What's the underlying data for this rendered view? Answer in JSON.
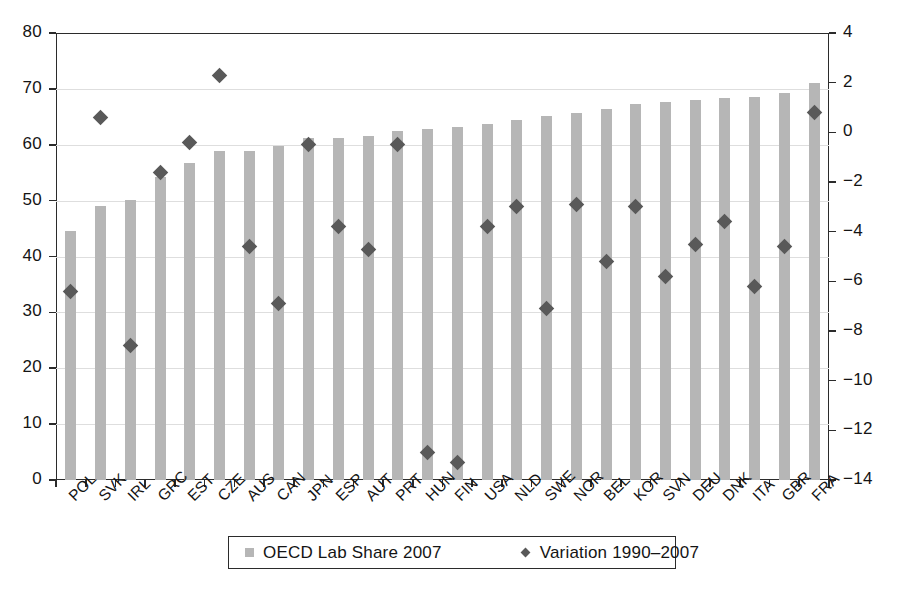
{
  "chart_data": {
    "type": "bar",
    "title": "",
    "subtitle": "",
    "xlabel": "",
    "ylabel": "",
    "y2label": "",
    "grid": true,
    "legend_position": "bottom",
    "categories": [
      "POL",
      "SVK",
      "IRL",
      "GRC",
      "EST",
      "CZE",
      "AUS",
      "CAN",
      "JPN",
      "ESP",
      "AUT",
      "PRT",
      "HUN",
      "FIN",
      "USA",
      "NLD",
      "SWE",
      "NOR",
      "BEL",
      "KOR",
      "SVN",
      "DEU",
      "DNK",
      "ITA",
      "GBR",
      "FRA"
    ],
    "ylim": [
      0,
      80
    ],
    "yticks": [
      0,
      10,
      20,
      30,
      40,
      50,
      60,
      70,
      80
    ],
    "ytick_labels": [
      "0",
      "10",
      "20",
      "30",
      "40",
      "50",
      "60",
      "70",
      "80"
    ],
    "y2lim": [
      -14,
      4
    ],
    "y2ticks": [
      -14,
      -12,
      -10,
      -8,
      -6,
      -4,
      -2,
      0,
      2,
      4
    ],
    "y2tick_labels": [
      "−14",
      "−12",
      "−10",
      "−8",
      "−6",
      "−4",
      "−2",
      "0",
      "2",
      "4"
    ],
    "series": [
      {
        "name": "OECD Lab Share 2007",
        "type": "bar",
        "axis": "left",
        "color": "#b6b6b6",
        "marker": "square",
        "values": [
          44.5,
          49.1,
          50.1,
          54.3,
          56.7,
          58.9,
          58.8,
          59.8,
          61.2,
          61.2,
          61.6,
          62.5,
          62.9,
          63.2,
          63.8,
          64.5,
          65.1,
          65.6,
          66.4,
          67.3,
          67.7,
          68.0,
          68.4,
          68.6,
          69.2,
          71.0
        ]
      },
      {
        "name": "Variation 1990–2007",
        "type": "scatter",
        "axis": "right",
        "color": "#595959",
        "marker": "diamond",
        "values": [
          -6.4,
          0.6,
          -8.6,
          -1.6,
          -0.4,
          2.3,
          -4.6,
          -6.9,
          -0.5,
          -3.8,
          -4.7,
          -0.5,
          -12.9,
          -13.3,
          -3.8,
          -3.0,
          -7.1,
          -2.9,
          -5.2,
          -3.0,
          -5.8,
          -4.5,
          -3.6,
          -6.2,
          -4.6,
          0.8
        ]
      }
    ]
  },
  "legend": {
    "items": [
      {
        "label": "OECD Lab Share 2007",
        "marker": "square",
        "color": "#b6b6b6"
      },
      {
        "label": "Variation 1990–2007",
        "marker": "diamond",
        "color": "#595959"
      }
    ]
  },
  "colors": {
    "bar": "#b6b6b6",
    "diamond": "#595959",
    "axis": "#2b2b2b",
    "grid": "#dedede",
    "background": "#ffffff"
  }
}
